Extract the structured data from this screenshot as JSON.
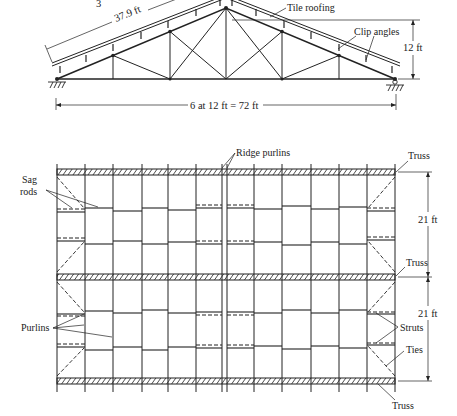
{
  "elevation": {
    "partial_top_label": "3",
    "slope_length_label": "37.9 ft",
    "tile_roofing_label": "Tile roofing",
    "clip_angles_label": "Clip angles",
    "rise_label": "12 ft",
    "span_label": "6 at 12 ft = 72 ft"
  },
  "plan": {
    "ridge_purlins_label": "Ridge purlins",
    "sag_rods_label_line1": "Sag",
    "sag_rods_label_line2": "rods",
    "purlins_label": "Purlins",
    "truss_label_top": "Truss",
    "truss_label_middle": "Truss",
    "truss_label_bottom": "Truss",
    "bay_1_label": "21 ft",
    "bay_2_label": "21 ft",
    "struts_label": "Struts",
    "ties_label": "Ties"
  },
  "colors": {
    "ink": "#222222",
    "background": "#ffffff"
  }
}
